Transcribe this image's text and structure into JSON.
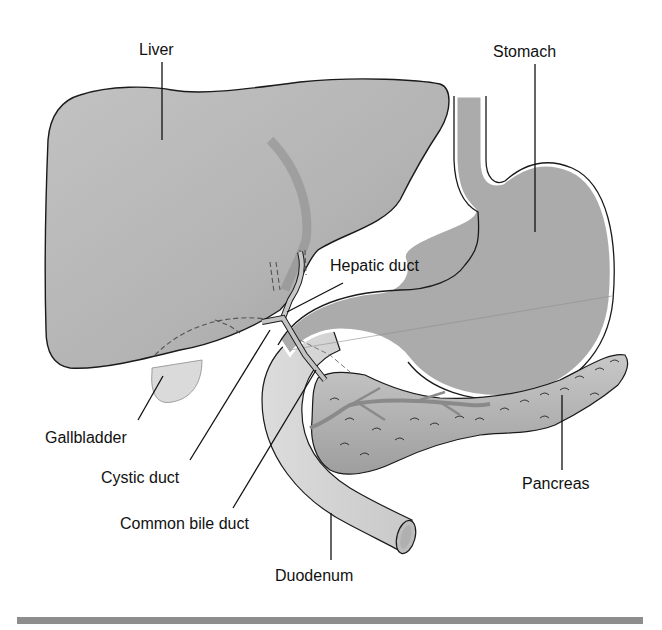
{
  "figure": {
    "labels": {
      "liver": "Liver",
      "stomach": "Stomach",
      "hepatic_duct": "Hepatic duct",
      "gallbladder": "Gallbladder",
      "cystic_duct": "Cystic duct",
      "common_bile_duct": "Common bile duct",
      "pancreas": "Pancreas",
      "duodenum": "Duodenum"
    },
    "colors": {
      "liver_fill": "#b4b4b4",
      "liver_shadow": "#8e8e8e",
      "stomach_fill": "#a9a9a9",
      "duodenum_fill": "#d2d2d2",
      "gallbladder_fill": "#dcdcdc",
      "pancreas_fill": "#b9b9b9",
      "outline": "#1a1a1a",
      "leader_line": "#111111",
      "bottom_rule": "#8d8d8d"
    }
  }
}
